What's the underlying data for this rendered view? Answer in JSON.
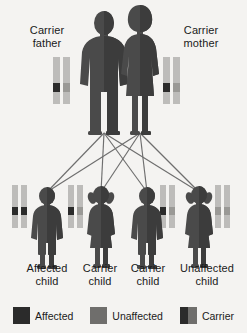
{
  "diagram": {
    "background_color": "#f4f3f1",
    "figure_color": "#4a4a4a",
    "figure_shadow_color": "#3a3a3a",
    "line_color": "#6e6e6e"
  },
  "colors": {
    "affected": "#2b2b2b",
    "unaffected": "#9a9996",
    "carrier_dark": "#2b2b2b",
    "carrier_light": "#9a9996",
    "chromosome_body": "#c2c1bf"
  },
  "parents": [
    {
      "id": "father",
      "label_line1": "Carrier",
      "label_line2": "father",
      "sex": "male",
      "status": "carrier",
      "chromosomes": [
        {
          "band": "affected"
        },
        {
          "band": "unaffected"
        }
      ]
    },
    {
      "id": "mother",
      "label_line1": "Carrier",
      "label_line2": "mother",
      "sex": "female",
      "status": "carrier",
      "chromosomes": [
        {
          "band": "affected"
        },
        {
          "band": "unaffected"
        }
      ]
    }
  ],
  "children": [
    {
      "id": "child-1",
      "label_line1": "Affected",
      "label_line2": "child",
      "sex": "male",
      "status": "affected",
      "chromosomes": [
        {
          "band": "affected"
        },
        {
          "band": "affected"
        }
      ]
    },
    {
      "id": "child-2",
      "label_line1": "Carrier",
      "label_line2": "child",
      "sex": "female",
      "status": "carrier",
      "chromosomes": [
        {
          "band": "affected"
        },
        {
          "band": "unaffected"
        }
      ]
    },
    {
      "id": "child-3",
      "label_line1": "Carrier",
      "label_line2": "child",
      "sex": "male",
      "status": "carrier",
      "chromosomes": [
        {
          "band": "affected"
        },
        {
          "band": "unaffected"
        }
      ]
    },
    {
      "id": "child-4",
      "label_line1": "Unaffected",
      "label_line2": "child",
      "sex": "female",
      "status": "unaffected",
      "chromosomes": [
        {
          "band": "unaffected"
        },
        {
          "band": "unaffected"
        }
      ]
    }
  ],
  "legend": {
    "items": [
      {
        "id": "legend-affected",
        "label": "Affected",
        "swatch": "solid-dark"
      },
      {
        "id": "legend-unaffected",
        "label": "Unaffected",
        "swatch": "solid-gray"
      },
      {
        "id": "legend-carrier",
        "label": "Carrier",
        "swatch": "split"
      }
    ]
  }
}
